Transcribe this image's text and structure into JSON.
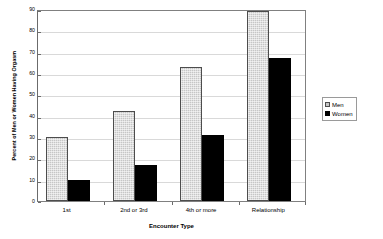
{
  "chart_data": {
    "type": "bar",
    "title": "",
    "subtitle": "",
    "xlabel": "Encounter Type",
    "ylabel": "Percent of Men or Women Having Orgasm",
    "categories": [
      "1st",
      "2nd or 3rd",
      "4th or more",
      "Relationship"
    ],
    "series": [
      {
        "name": "Men",
        "values": [
          30,
          42,
          63,
          89
        ],
        "color": "#c6c6c6",
        "fill": "light-gray-speckled",
        "border_color": "#4d4d4d"
      },
      {
        "name": "Women",
        "values": [
          10,
          17,
          31,
          67
        ],
        "color": "#000000",
        "fill": "solid-black",
        "border_color": "#000000"
      }
    ],
    "ylim": [
      0,
      90
    ],
    "ytick_step": 10,
    "yticks": [
      0,
      10,
      20,
      30,
      40,
      50,
      60,
      70,
      80,
      90
    ],
    "ytick_labels": [
      "0",
      "10",
      "20",
      "30",
      "40",
      "50",
      "60",
      "70",
      "80",
      "90"
    ],
    "grid": "horizontal",
    "grid_color": "#d9d9d9",
    "legend": {
      "position": "right",
      "entries": [
        {
          "label": "Men",
          "swatch": "light-gray-speckled-square"
        },
        {
          "label": "Women",
          "swatch": "black-square"
        }
      ]
    },
    "plot_border": true,
    "plot_border_color": "#808080",
    "background": "#ffffff"
  }
}
